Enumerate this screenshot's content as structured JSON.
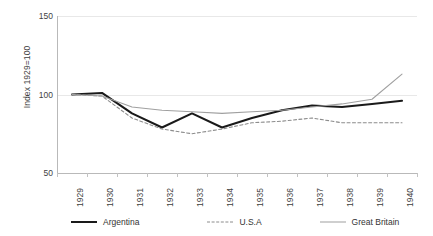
{
  "chart_data": {
    "type": "line",
    "title": "",
    "xlabel": "",
    "ylabel": "Index 1929=100",
    "categories": [
      "1929",
      "1930",
      "1931",
      "1932",
      "1933",
      "1934",
      "1935",
      "1936",
      "1937",
      "1938",
      "1939",
      "1940"
    ],
    "ylim": [
      50,
      150
    ],
    "yticks": [
      "50",
      "100",
      "150"
    ],
    "ytick_values": [
      50,
      100,
      150
    ],
    "grid": true,
    "legend_position": "bottom",
    "series": [
      {
        "name": "Argentina",
        "style": "solid",
        "color": "#1a1a1a",
        "width": 2.1,
        "values": [
          100,
          101,
          88,
          79,
          88,
          79,
          85,
          90,
          93,
          92,
          94,
          96
        ]
      },
      {
        "name": "U.S.A",
        "style": "dashed",
        "color": "#8c8c8c",
        "width": 1.1,
        "values": [
          100,
          99,
          85,
          78,
          75,
          78,
          82,
          83,
          85,
          82,
          82,
          82
        ]
      },
      {
        "name": "Great Britain",
        "style": "solid",
        "color": "#a0a0a0",
        "width": 1.1,
        "values": [
          100,
          99,
          92,
          90,
          89,
          88,
          89,
          90,
          92,
          94,
          97,
          113
        ]
      }
    ]
  },
  "axes": {
    "y_title": "Index 1929=100"
  },
  "colors": {
    "argentina": "#1a1a1a",
    "usa": "#8c8c8c",
    "great_britain": "#a0a0a0",
    "grid": "#e8e8e8",
    "axis": "#b9b9b9",
    "text": "#3f3f3f",
    "background": "#ffffff"
  }
}
